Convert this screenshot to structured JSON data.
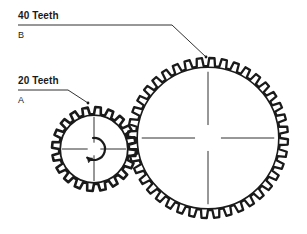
{
  "diagram": {
    "background_color": "#ffffff",
    "line_color": "#1a1a1a",
    "labels": {
      "gear_b": {
        "teeth_label": "40 Teeth",
        "id_label": "B",
        "underline": true
      },
      "gear_a": {
        "teeth_label": "20 Teeth",
        "id_label": "A",
        "underline": true
      }
    },
    "gears": [
      {
        "name": "gear-a-small",
        "id": "A",
        "teeth": 20,
        "center_x": 94,
        "center_y": 149,
        "outer_radius": 42,
        "root_radius": 35,
        "has_center_crosshair": true,
        "rotation_arrow": "counterclockwise"
      },
      {
        "name": "gear-b-large",
        "id": "B",
        "teeth": 40,
        "center_x": 208,
        "center_y": 138,
        "outer_radius": 80,
        "root_radius": 72,
        "has_center_crosshair": true,
        "rotation_arrow": "none"
      }
    ],
    "leader_lines": [
      {
        "name": "leader-line-b",
        "points": "18,25 172,25 206,57"
      },
      {
        "name": "leader-line-a",
        "points": "18,90 68,90 88,103"
      }
    ]
  }
}
